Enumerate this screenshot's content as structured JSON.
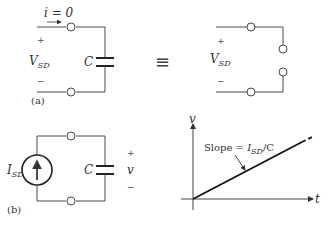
{
  "figure": {
    "part_a": {
      "label": "(a)",
      "current_label": "i = 0",
      "voltage_label": "V",
      "voltage_sub": "SD",
      "plus": "+",
      "minus": "−",
      "capacitor_label": "C"
    },
    "equivalence_symbol": "≡",
    "part_a_equivalent": {
      "voltage_label": "V",
      "voltage_sub": "SD",
      "plus": "+",
      "minus": "−"
    },
    "part_b": {
      "label": "(b)",
      "source_label": "I",
      "source_sub": "SD",
      "capacitor_label": "C",
      "voltage_label": "v",
      "plus": "+",
      "minus": "−"
    },
    "graph": {
      "y_axis_label": "v",
      "x_axis_label": "t",
      "slope_text_prefix": "Slope = ",
      "slope_var": "I",
      "slope_sub": "SD",
      "slope_suffix": "/C"
    }
  }
}
